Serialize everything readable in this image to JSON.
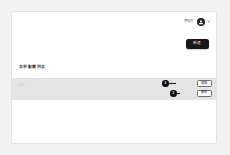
{
  "page": {
    "background_color": "#f2f2f3",
    "card_background": "#ffffff",
    "accent_dark": "#17171a",
    "row_highlight_color": "#e4e4e5"
  },
  "topbar": {
    "user_name": "管理员",
    "avatar_icon": "user-avatar-icon",
    "dropdown_icon": "chevron-down-icon"
  },
  "actions": {
    "primary_label": "新建"
  },
  "section": {
    "heading": "表单配置列表"
  },
  "list": {
    "rows": [
      {
        "label": "名称",
        "highlighted": true
      }
    ]
  },
  "annotations": [
    {
      "number": "1",
      "target_label": "编辑"
    },
    {
      "number": "2",
      "target_label": "删除"
    }
  ],
  "row_actions": [
    {
      "label": "编辑"
    },
    {
      "label": "删除"
    }
  ]
}
